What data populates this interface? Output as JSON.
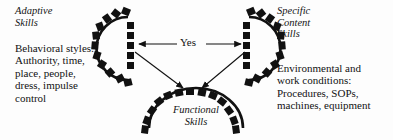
{
  "diagram": {
    "background_color": "#fdfdfd",
    "ink_color": "#111111",
    "nodes": {
      "left": {
        "name": "adaptive-skills",
        "heading": "Adaptive\nSkills",
        "body": "Behavioral styles:\nAuthority, time,\nplace, people,\ndress, impulse\ncontrol",
        "shape": "gear-arc-open-right"
      },
      "right": {
        "name": "specific-content-skills",
        "heading": "Specific\nContent\nSkills",
        "body": "Environmental and\nwork conditions:\nProcedures, SOPs,\nmachines, equipment",
        "shape": "gear-arc-open-left"
      },
      "bottom": {
        "name": "functional-skills",
        "label": "Functional\nSkills",
        "shape": "gear-arc-open-down"
      }
    },
    "connectors": {
      "horizontal_label": "Yes",
      "horizontal_description": "double-headed arrow between adaptive skills and specific content skills",
      "diagonal_left_description": "arrow from adaptive skills to functional skills",
      "diagonal_right_description": "arrow from specific content skills to functional skills"
    }
  }
}
